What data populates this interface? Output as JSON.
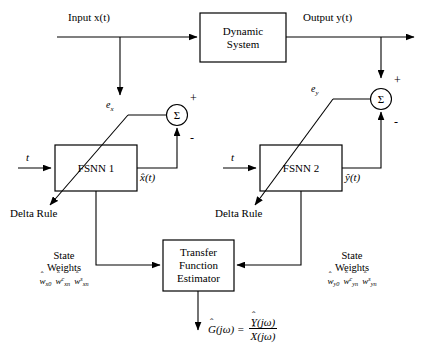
{
  "figure": {
    "caption": ""
  },
  "signals": {
    "input": "Input x(t)",
    "output": "Output y(t)",
    "time_left": "t",
    "time_right": "t",
    "x_hat": "x̂(t)",
    "y_hat": "ŷ(t)",
    "error_x": "e",
    "error_x_sub": "x",
    "error_y": "e",
    "error_y_sub": "y"
  },
  "blocks": {
    "dynamic_system": {
      "line1": "Dynamic",
      "line2": "System"
    },
    "fsnn1": {
      "label": "FSNN 1"
    },
    "fsnn2": {
      "label": "FSNN 2"
    },
    "estimator": {
      "line1": "Transfer",
      "line2": "Function",
      "line3": "Estimator"
    }
  },
  "adaptation": {
    "delta_rule_left": "Delta Rule",
    "delta_rule_right": "Delta Rule"
  },
  "summing": {
    "left": {
      "symbol": "Σ",
      "sign_top": "+",
      "sign_bottom": "-"
    },
    "right": {
      "symbol": "Σ",
      "sign_top": "+",
      "sign_bottom": "-"
    }
  },
  "state_weights_left": {
    "line1": "State",
    "line2": "Weights",
    "weights": [
      {
        "base": "w",
        "sub": "x0",
        "sup": ""
      },
      {
        "base": "w",
        "sub": "xn",
        "sup": "c"
      },
      {
        "base": "w",
        "sub": "xn",
        "sup": "s"
      }
    ]
  },
  "state_weights_right": {
    "line1": "State",
    "line2": "Weights",
    "weights": [
      {
        "base": "w",
        "sub": "y0",
        "sup": ""
      },
      {
        "base": "w",
        "sub": "yn",
        "sup": "c"
      },
      {
        "base": "w",
        "sub": "yn",
        "sup": "s"
      }
    ]
  },
  "result_formula": {
    "lhs": "G",
    "lhs_arg": "(jω)",
    "equals": "=",
    "numerator": "Y",
    "numerator_arg": "(jω)",
    "denominator": "X",
    "denominator_arg": "(jω)"
  },
  "colors": {
    "line": "#000000",
    "background": "#ffffff",
    "text": "#000000"
  }
}
